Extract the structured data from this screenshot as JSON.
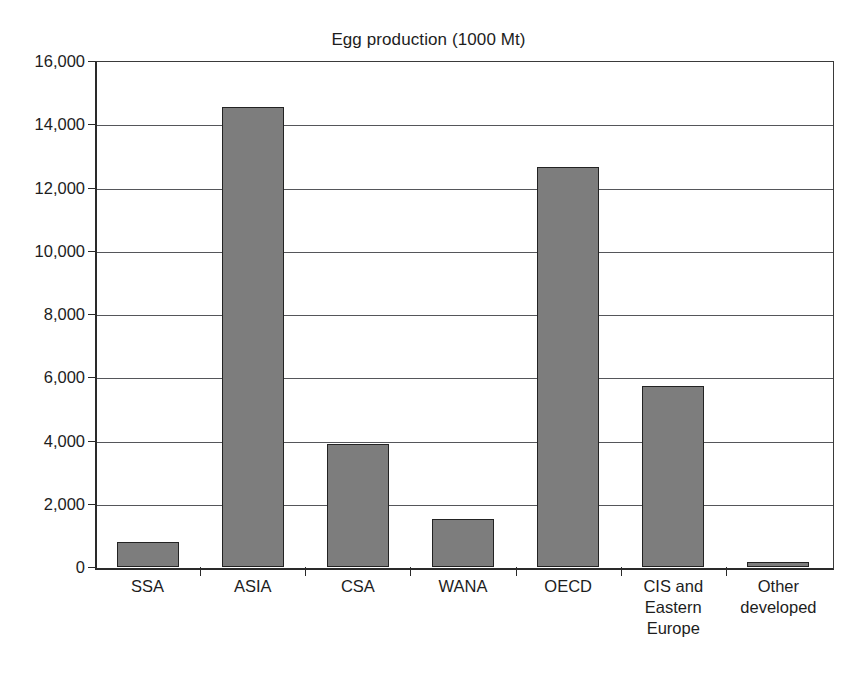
{
  "chart_data": {
    "type": "bar",
    "title": "Egg production (1000 Mt)",
    "xlabel": "",
    "ylabel": "",
    "ylim": [
      0,
      16000
    ],
    "ytick_step": 2000,
    "ytick_labels": [
      "16,000",
      "14,000",
      "12,000",
      "10,000",
      "8,000",
      "6,000",
      "4,000",
      "2,000",
      "0"
    ],
    "ytick_values": [
      16000,
      14000,
      12000,
      10000,
      8000,
      6000,
      4000,
      2000,
      0
    ],
    "grid": "horizontal",
    "legend": "none",
    "categories": [
      "SSA",
      "ASIA",
      "CSA",
      "WANA",
      "OECD",
      "CIS and Eastern Europe",
      "Other developed"
    ],
    "category_lines": [
      [
        "SSA"
      ],
      [
        "ASIA"
      ],
      [
        "CSA"
      ],
      [
        "WANA"
      ],
      [
        "OECD"
      ],
      [
        "CIS and",
        "Eastern",
        "Europe"
      ],
      [
        "Other",
        "developed"
      ]
    ],
    "values": [
      780,
      14550,
      3880,
      1520,
      12650,
      5720,
      170
    ],
    "bar_color": "#7d7d7d",
    "bar_edge_color": "#232323",
    "axis_color": "#2a2a2a",
    "gridline_color": "#55565a",
    "background_color": "#ffffff"
  },
  "caption": {
    "partial_text": ""
  }
}
